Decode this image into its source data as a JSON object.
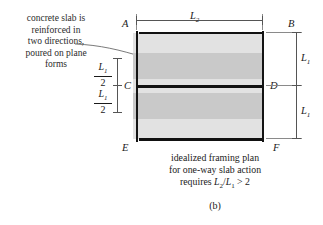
{
  "figure": {
    "sublabel": "(b)"
  },
  "annotation": {
    "lines": [
      "concrete slab is",
      "reinforced in",
      "two directions,",
      "poured on plane",
      "forms"
    ]
  },
  "caption": {
    "line1": "idealized framing plan",
    "line2": "for one-way slab action",
    "line3_prefix": "requires ",
    "line3_expr_a": "L",
    "line3_sub_a": "2",
    "line3_slash": "/",
    "line3_expr_b": "L",
    "line3_sub_b": "1",
    "line3_suffix": " > 2"
  },
  "nodes": {
    "a": "A",
    "b": "B",
    "c": "C",
    "d": "D",
    "e": "E",
    "f": "F"
  },
  "dimensions": {
    "top": {
      "symbol": "L",
      "subscript": "2"
    },
    "right_upper": {
      "symbol": "L",
      "subscript": "1"
    },
    "right_lower": {
      "symbol": "L",
      "subscript": "1"
    },
    "left_upper": {
      "numerator_symbol": "L",
      "numerator_subscript": "1",
      "denominator": "2"
    },
    "left_lower": {
      "numerator_symbol": "L",
      "numerator_subscript": "1",
      "denominator": "2"
    }
  },
  "colors": {
    "band_light": "#e2e2e2",
    "band_dark": "#c9c9c9",
    "beam": "#111111",
    "dimension": "#555555",
    "background": "#ffffff"
  }
}
